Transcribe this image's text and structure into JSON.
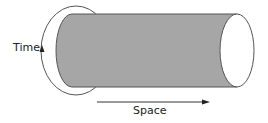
{
  "diagram": {
    "labels": {
      "time": "Time",
      "space": "Space"
    },
    "colors": {
      "cylinder_fill": "#a6a6a6",
      "stroke": "#555555",
      "end_cap_fill": "#ffffff",
      "text": "#222222"
    }
  }
}
